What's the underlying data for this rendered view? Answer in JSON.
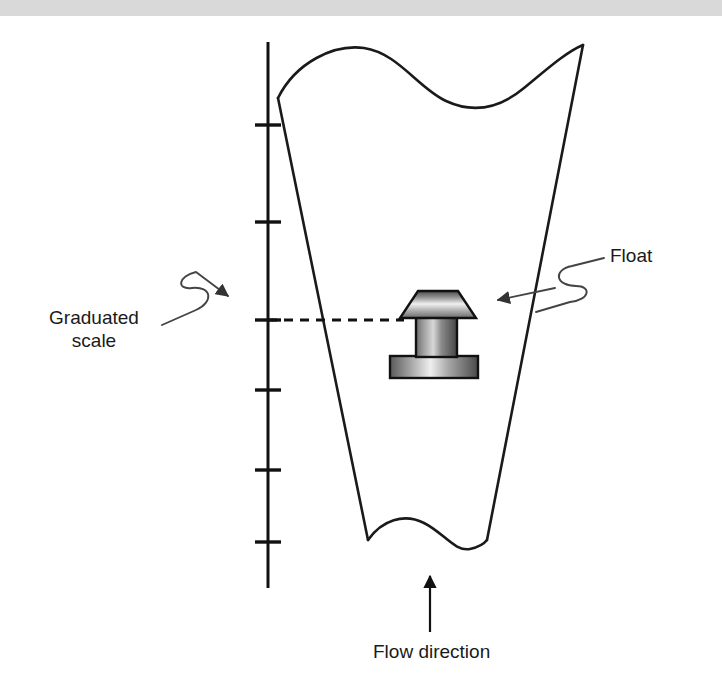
{
  "figure": {
    "width": 722,
    "height": 690,
    "background_color": "#ffffff",
    "line_color": "#1a1a1a",
    "top_band_color": "#d9d9d9"
  },
  "labels": {
    "graduated_scale_line1": "Graduated",
    "graduated_scale_line2": "scale",
    "float": "Float",
    "flow_direction": "Flow direction"
  },
  "diagram": {
    "scale": {
      "name": "graduated-scale",
      "x": 268,
      "y_top": 42,
      "y_bottom": 588,
      "tick_half_width": 13,
      "tick_positions_y": [
        125,
        222,
        320,
        390,
        470,
        542
      ],
      "tick_count": 6
    },
    "tube": {
      "name": "tapered-measuring-tube",
      "description": "tapered glass tube, wider at top, with wavy break lines at top and bottom",
      "top_left_x": 278,
      "top_right_x": 583,
      "bottom_left_x": 368,
      "bottom_right_x": 487,
      "top_y": 98,
      "bottom_y": 540
    },
    "float": {
      "name": "float-body",
      "cone_left_x": 400,
      "cone_right_x": 476,
      "cone_top_left_x": 418,
      "cone_top_right_x": 458,
      "cone_top_y": 291,
      "cone_bottom_y": 318,
      "stem_left_x": 416,
      "stem_right_x": 457,
      "stem_top_y": 318,
      "stem_bottom_y": 356,
      "base_left_x": 390,
      "base_right_x": 478,
      "base_top_y": 356,
      "base_bottom_y": 378,
      "gradient_light": "#f2f2f2",
      "gradient_dark": "#555555"
    },
    "reading_line": {
      "name": "float-reading-dashed-line",
      "y": 320,
      "x_start": 268,
      "x_end": 404,
      "style": "dashed"
    },
    "leaders": {
      "graduated_scale_arrow_tip": [
        259,
        284
      ],
      "float_arrow_tip": [
        480,
        305
      ],
      "flow_arrow_tip": [
        430,
        572
      ],
      "flow_arrow_tail": [
        430,
        632
      ]
    }
  }
}
